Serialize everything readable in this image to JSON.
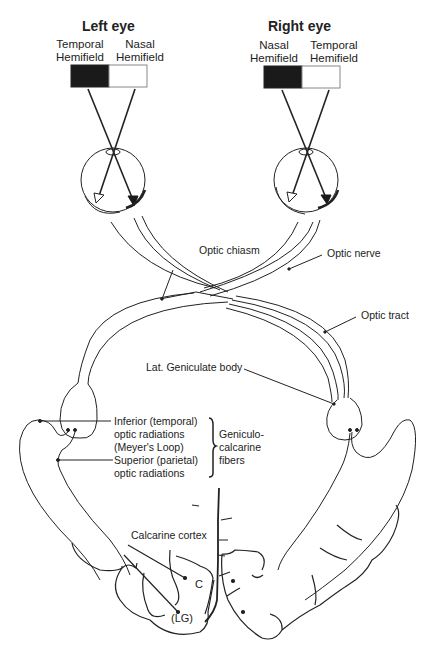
{
  "left_eye": {
    "title": "Left eye",
    "temporal": [
      "Temporal",
      "Hemifield"
    ],
    "nasal": [
      "Nasal",
      "Hemifield"
    ]
  },
  "right_eye": {
    "title": "Right eye",
    "nasal": [
      "Nasal",
      "Hemifield"
    ],
    "temporal": [
      "Temporal",
      "Hemifield"
    ]
  },
  "labels": {
    "optic_chiasm": "Optic chiasm",
    "optic_nerve": "Optic nerve",
    "optic_tract": "Optic tract",
    "lat_geniculate": "Lat. Geniculate body",
    "inferior": [
      "Inferior (temporal)",
      "optic radiations",
      "(Meyer's Loop)"
    ],
    "superior": [
      "Superior (parietal)",
      "optic radiations"
    ],
    "geniculo": [
      "Geniculo-",
      "calcarine",
      "fibers"
    ],
    "calcarine_cortex": "Calcarine cortex",
    "c": "C",
    "lg": "(LG)"
  },
  "colors": {
    "line": "#222222",
    "fill_dark": "#1a1a1a",
    "background": "#ffffff"
  }
}
